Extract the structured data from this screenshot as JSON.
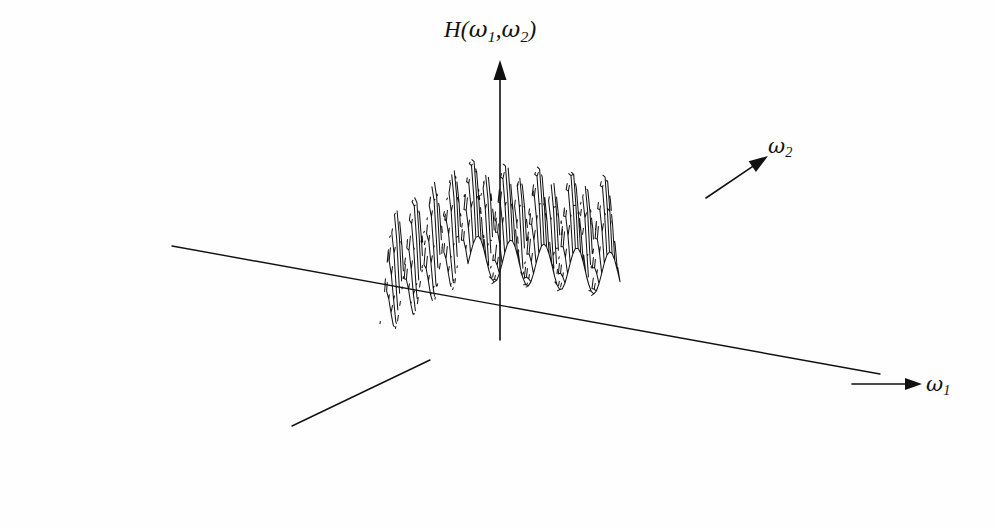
{
  "figure": {
    "kind": "3d-wireframe-surface-plot",
    "background_color": "#fefefe",
    "line_color": "#151515",
    "width": 995,
    "height": 529
  },
  "labels": {
    "vertical_axis": "H(ω₁,ω₂)",
    "vertical_axis_plain": "H(w1,w2)",
    "axis_w1": "ω₁",
    "axis_w2": "ω₂",
    "h_head": "H",
    "h_open": "(",
    "h_omega": "ω",
    "h_sub1": "1",
    "h_comma": ",",
    "h_sub2": "2",
    "h_close": ")",
    "w1_omega": "ω",
    "w1_sub": "1",
    "w2_omega": "ω",
    "w2_sub": "2"
  },
  "chart_data": {
    "type": "surface",
    "subtitle": "",
    "xlabel": "ω₁",
    "ylabel": "ω₂",
    "zlabel": "H(ω₁,ω₂)",
    "grid": false,
    "legend": false,
    "legend_position": "none",
    "xlim": [
      -3.14159,
      3.14159
    ],
    "ylim": [
      -3.14159,
      3.14159
    ],
    "zlim": [
      0,
      1
    ],
    "surface_function": "z = 0.5*(1+cos(4.6*x)) * 0.5*(1+cos(4.6*y))",
    "cycles_x": 4.6,
    "cycles_y": 4.6,
    "mesh_nu": 58,
    "mesh_nv": 40,
    "peak_count_x": 5,
    "peak_count_y": 4,
    "peak_height": 1.0,
    "valley_height": 0.0,
    "projection": {
      "type": "oblique-parallel",
      "origin_px": [
        500,
        318
      ],
      "u_axis_px": [
        76.0,
        9.0
      ],
      "v_axis_px": [
        44.0,
        -30.0
      ],
      "z_axis_px": [
        0.0,
        -128.0
      ],
      "azimuth_deg": 37,
      "elevation_deg": 22
    },
    "axes_arrows": [
      {
        "name": "ω₁",
        "from_px": [
          172,
          246
        ],
        "to_px": [
          924,
          382
        ],
        "head": "right"
      },
      {
        "name": "ω₂",
        "from_px": [
          292,
          426
        ],
        "to_px": [
          766,
          158
        ],
        "head": "up-right"
      },
      {
        "name": "H(ω₁,ω₂)",
        "from_px": [
          500,
          340
        ],
        "to_px": [
          500,
          60
        ],
        "head": "up"
      }
    ]
  }
}
